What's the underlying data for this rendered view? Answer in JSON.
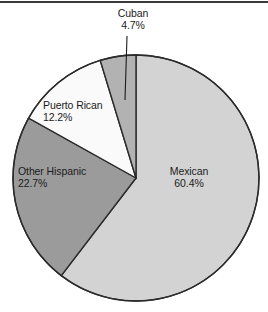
{
  "figure": {
    "has_top_rule": true,
    "background_color": "#ffffff",
    "outline_color": "#2b2b2b"
  },
  "chart_data": {
    "type": "pie",
    "title": "",
    "xlabel": "",
    "ylabel": "",
    "legend_position": "none",
    "grid": false,
    "labels_inside_slices": true,
    "units": "percent",
    "start_angle_deg": 0,
    "direction": "clockwise",
    "categories": [
      "Mexican",
      "Other Hispanic",
      "Puerto Rican",
      "Cuban"
    ],
    "values": [
      60.4,
      22.7,
      12.2,
      4.7
    ],
    "value_strings": [
      "60.4%",
      "22.7%",
      "12.2%",
      "4.7%"
    ],
    "colors": [
      "#d3d3d3",
      "#9b9b9b",
      "#fafafa",
      "#b2b2b2"
    ],
    "slices": [
      {
        "name": "Mexican",
        "value": 60.4,
        "value_text": "60.4%",
        "color": "#d3d3d3",
        "label_placement": "inside",
        "has_leader_line": false
      },
      {
        "name": "Other Hispanic",
        "value": 22.7,
        "value_text": "22.7%",
        "color": "#9b9b9b",
        "label_placement": "inside",
        "has_leader_line": false
      },
      {
        "name": "Puerto Rican",
        "value": 12.2,
        "value_text": "12.2%",
        "color": "#fafafa",
        "label_placement": "inside",
        "has_leader_line": false
      },
      {
        "name": "Cuban",
        "value": 4.7,
        "value_text": "4.7%",
        "color": "#b2b2b2",
        "label_placement": "outside-top",
        "has_leader_line": true
      }
    ]
  }
}
